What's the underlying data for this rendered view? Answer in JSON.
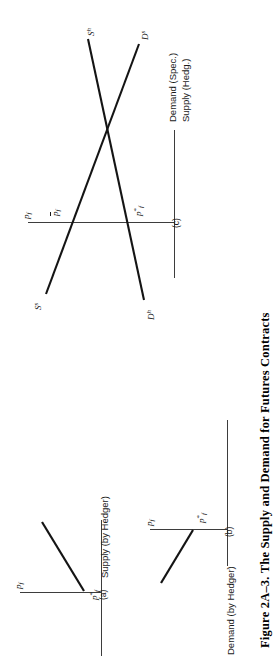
{
  "figure": {
    "caption": "Figure 2A–3.  The Supply and Demand for Futures Contracts",
    "caption_number": "Figure 2A–3.",
    "caption_title": "The Supply and Demand for Futures Contracts",
    "orientation": "rotated-90-ccw",
    "background_color": "#ffffff",
    "line_color": "#141414",
    "axis_color": "#3d3d3d"
  },
  "panels": [
    {
      "id": "a",
      "panel_label": "(a)",
      "vertical_axis_label": "p_f",
      "horizontal_axis_label": "Supply (by Hedger)",
      "point_label": "p*_f",
      "curve": {
        "name": "supply-by-hedger-curve",
        "shape": "upward-sloping-ray",
        "note": "kinked ray rising from the p*_f point on the price axis"
      }
    },
    {
      "id": "b",
      "panel_label": "(b)",
      "vertical_axis_label": "p_f",
      "horizontal_axis_label": "Demand (by Hedger)",
      "point_label": "p*_f",
      "curve": {
        "name": "demand-by-hedger-curve",
        "shape": "downward-sloping-ray",
        "note": "ray falling away from the p*_f point on the price axis"
      }
    },
    {
      "id": "c",
      "panel_label": "(c)",
      "vertical_axis_label": "p_f",
      "horizontal_axis_label_1": "Demand (Spec.)",
      "horizontal_axis_label_2": "Supply (Hedg.)",
      "point_labels": [
        "p̄_f",
        "p*_f"
      ],
      "curves": [
        {
          "name": "supply-hedger-curve",
          "label": "S^h",
          "base": "S",
          "exponent": "h",
          "slope": "upward"
        },
        {
          "name": "demand-speculator-curve",
          "label": "D^s",
          "base": "D",
          "exponent": "s",
          "slope": "downward"
        },
        {
          "name": "supply-speculator-curve",
          "label": "S^s",
          "base": "S",
          "exponent": "s",
          "slope": "upward"
        },
        {
          "name": "demand-hedger-curve",
          "label": "D^h",
          "base": "D",
          "exponent": "h",
          "slope": "downward"
        }
      ]
    }
  ],
  "symbols": {
    "price": "p",
    "subscript_f": "f",
    "star": "*",
    "bar_price": "p̄"
  }
}
